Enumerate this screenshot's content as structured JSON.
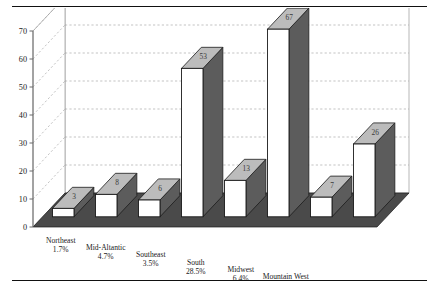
{
  "page": {
    "top_rule": "",
    "bottom_rule": "",
    "clipped_header_text": ""
  },
  "chart_data": {
    "type": "bar",
    "title": "",
    "subtitle": "",
    "xlabel": "",
    "ylabel": "",
    "ylim": [
      0,
      70
    ],
    "yticks": [
      0,
      10,
      20,
      30,
      40,
      50,
      60,
      70
    ],
    "ytick_labels": [
      "0",
      "10",
      "20",
      "30",
      "40",
      "50",
      "60",
      "70"
    ],
    "grid": true,
    "grid_style": "dashed-horizontal-on-back-wall",
    "legend": null,
    "legend_position": "none",
    "three_d": true,
    "categories": [
      "Northeast",
      "Mid-Altantic",
      "Southeast",
      "South",
      "Midwest",
      "Mountain West",
      "Northwest",
      "West"
    ],
    "category_percents": [
      "1.7%",
      "4.7%",
      "3.5%",
      "28.5%",
      "6.4%",
      "37.8%",
      "4.1%",
      "13.7%"
    ],
    "values": [
      3,
      8,
      6,
      53,
      13,
      67,
      7,
      26
    ],
    "value_labels": [
      "3",
      "8",
      "6",
      "53",
      "13",
      "67",
      "7",
      "26"
    ],
    "colors": {
      "bar_front": "#ffffff",
      "bar_side": "#5c5c5c",
      "bar_top": "#bcbcbc",
      "bar_outline": "#1a1a1a",
      "floor": "#4a4a4a",
      "back_wall": "#ffffff",
      "gridline": "#9a9a9a",
      "axis": "#6a6a6a",
      "text": "#1a1a1a"
    }
  }
}
